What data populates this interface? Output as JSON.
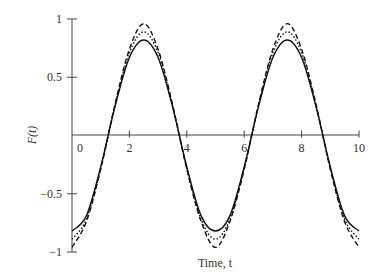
{
  "chart_data": {
    "type": "line",
    "title": "",
    "xlabel": "Time, t",
    "ylabel": "F(t)",
    "xlim": [
      0,
      10
    ],
    "ylim": [
      -1,
      1
    ],
    "grid": false,
    "legend": null,
    "x_ticks": [
      0,
      2,
      4,
      6,
      8,
      10
    ],
    "x_tick_labels": [
      "0",
      "2",
      "4",
      "6",
      "8",
      "10"
    ],
    "y_ticks": [
      1,
      0.5,
      -0.5,
      -1
    ],
    "y_tick_labels": [
      "1",
      "0.5",
      "−0.5",
      "−1"
    ],
    "series": [
      {
        "name": "solid",
        "style": "solid",
        "x": [
          0,
          0.5,
          1,
          1.5,
          2,
          2.5,
          3,
          3.5,
          4,
          4.5,
          5,
          5.5,
          6,
          6.5,
          7,
          7.5,
          8,
          8.5,
          9,
          9.5,
          10
        ],
        "values": [
          -0.82,
          -0.69,
          -0.27,
          0.25,
          0.67,
          0.82,
          0.67,
          0.25,
          -0.27,
          -0.69,
          -0.82,
          -0.69,
          -0.27,
          0.25,
          0.67,
          0.82,
          0.67,
          0.25,
          -0.27,
          -0.69,
          -0.82
        ]
      },
      {
        "name": "dotted",
        "style": "dotted",
        "x": [
          0,
          0.5,
          1,
          1.5,
          2,
          2.5,
          3,
          3.5,
          4,
          4.5,
          5,
          5.5,
          6,
          6.5,
          7,
          7.5,
          8,
          8.5,
          9,
          9.5,
          10
        ],
        "values": [
          -0.89,
          -0.72,
          -0.28,
          0.26,
          0.71,
          0.89,
          0.71,
          0.26,
          -0.28,
          -0.72,
          -0.89,
          -0.72,
          -0.28,
          0.26,
          0.71,
          0.89,
          0.71,
          0.26,
          -0.28,
          -0.72,
          -0.89
        ]
      },
      {
        "name": "dashed",
        "style": "dashed",
        "x": [
          0,
          0.5,
          1,
          1.5,
          2,
          2.5,
          3,
          3.5,
          4,
          4.5,
          5,
          5.5,
          6,
          6.5,
          7,
          7.5,
          8,
          8.5,
          9,
          9.5,
          10
        ],
        "values": [
          -0.96,
          -0.74,
          -0.29,
          0.27,
          0.74,
          0.96,
          0.74,
          0.27,
          -0.29,
          -0.74,
          -0.96,
          -0.74,
          -0.29,
          0.27,
          0.74,
          0.96,
          0.74,
          0.27,
          -0.29,
          -0.74,
          -0.96
        ]
      }
    ]
  }
}
